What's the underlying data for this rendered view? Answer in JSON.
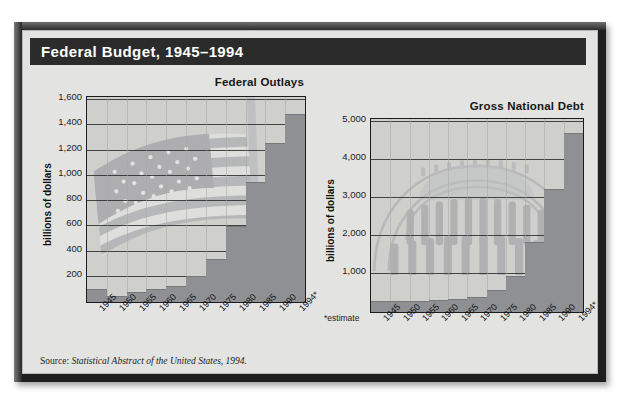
{
  "figure": {
    "title": "Federal Budget, 1945–1994",
    "source_prefix": "Source: ",
    "source_italic": "Statistical Abstract of the United States, 1994.",
    "estimate_note": "*estimate",
    "colors": {
      "frame": "#1f1f1f",
      "panel": "#e3e3e1",
      "title_bar": "#2b2b2b",
      "title_text": "#ffffff",
      "plot_bg": "#cfcfcc",
      "bar": "#8e9094",
      "gridline": "#2a2a2a",
      "axis_text": "#1c1c1c"
    }
  },
  "chart_data": [
    {
      "type": "bar",
      "title": "Federal Outlays",
      "xlabel": "",
      "ylabel": "billions of dollars",
      "ylim": [
        0,
        1600
      ],
      "yticks": [
        200,
        400,
        600,
        800,
        1000,
        1200,
        1400,
        1600
      ],
      "ytick_labels": [
        "200",
        "400",
        "600",
        "800",
        "1,000",
        "1,200",
        "1,400",
        "1,600"
      ],
      "grid": true,
      "legend": "none",
      "categories": [
        "1945",
        "1950",
        "1955",
        "1960",
        "1965",
        "1970",
        "1975",
        "1980",
        "1985",
        "1990",
        "1994*"
      ],
      "values": [
        93,
        43,
        68,
        92,
        118,
        196,
        332,
        591,
        946,
        1253,
        1484
      ]
    },
    {
      "type": "bar",
      "title": "Gross National Debt",
      "xlabel": "",
      "ylabel": "billions of dollars",
      "ylim": [
        0,
        5000
      ],
      "yticks": [
        1000,
        2000,
        3000,
        4000,
        5000
      ],
      "ytick_labels": [
        "1,000",
        "2,000",
        "3,000",
        "4,000",
        "5,000"
      ],
      "grid": true,
      "legend": "none",
      "categories": [
        "1945",
        "1950",
        "1955",
        "1960",
        "1965",
        "1970",
        "1975",
        "1980",
        "1985",
        "1990",
        "1994*"
      ],
      "values": [
        259,
        257,
        274,
        291,
        322,
        381,
        542,
        909,
        1817,
        3206,
        4694
      ]
    }
  ]
}
